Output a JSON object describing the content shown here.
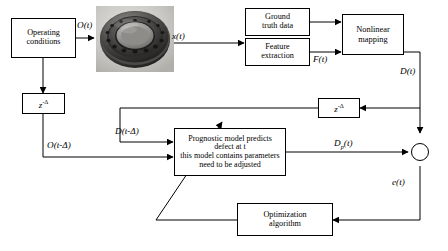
{
  "diagram": {
    "background_color": "#ffffff",
    "line_color": "#000000",
    "boxes": {
      "operating_conditions": "Operating\nconditions",
      "ground_truth": "Ground\ntruth data",
      "feature_extraction": "Feature\nextraction",
      "nonlinear_mapping": "Nonlinear\nmapping",
      "prognostic_model": "Prognostic model predicts\ndefect at t\nthis model contains parameters\nneed to be adjusted",
      "optimization_algorithm": "Optimization\nalgorithm",
      "delay_left": "z",
      "delay_left_sup": "-Δ",
      "delay_right": "z",
      "delay_right_sup": "-Δ"
    },
    "signals": {
      "o_t": "O(t)",
      "x_t": "x(t)",
      "f_t": "F(t)",
      "d_t": "D(t)",
      "d_t_delta": "D(t-Δ)",
      "o_t_delta": "O(t-Δ)",
      "d_p_t_base": "D",
      "d_p_t_sub": "p",
      "d_p_t_tail": "(t)",
      "e_t": "e(t)"
    },
    "image": {
      "bearing": "rolling-element-bearing-photo"
    },
    "junction": {
      "summing_node": "summing-junction"
    }
  }
}
